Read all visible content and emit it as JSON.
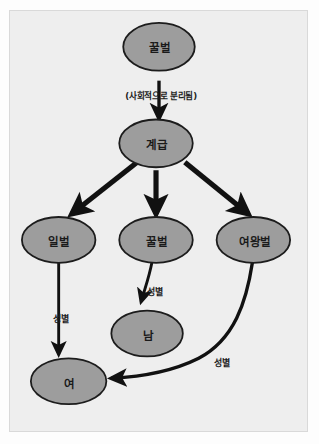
{
  "figure": {
    "background_color": "#eeeeee",
    "frame_color": "#d9d9d9",
    "node_fill": "#9d9d9d",
    "node_stroke": "#1c1c1c",
    "edge_color": "#111111",
    "text_color": "#1a1a1a"
  },
  "nodes": [
    {
      "id": "honeybee-root",
      "label": "꿀벌",
      "cx": 159,
      "cy": 45,
      "rx": 36,
      "ry": 24
    },
    {
      "id": "caste",
      "label": "계급",
      "cx": 155,
      "cy": 141,
      "rx": 37,
      "ry": 24
    },
    {
      "id": "worker-bee",
      "label": "일벌",
      "cx": 57,
      "cy": 241,
      "rx": 37,
      "ry": 23
    },
    {
      "id": "drone-bee",
      "label": "꿀벌",
      "cx": 155,
      "cy": 240,
      "rx": 37,
      "ry": 23
    },
    {
      "id": "queen-bee",
      "label": "여왕벌",
      "cx": 253,
      "cy": 240,
      "rx": 37,
      "ry": 23
    },
    {
      "id": "male",
      "label": "남",
      "cx": 146,
      "cy": 334,
      "rx": 36,
      "ry": 23
    },
    {
      "id": "female",
      "label": "여",
      "cx": 67,
      "cy": 382,
      "rx": 38,
      "ry": 23
    }
  ],
  "edges": [
    {
      "id": "honeybee-to-caste",
      "from": "honeybee-root",
      "to": "caste",
      "label": "(사회적으로 분리됨)",
      "label_x": 160,
      "label_y": 94,
      "style": "caption"
    },
    {
      "id": "caste-to-worker",
      "from": "caste",
      "to": "worker-bee",
      "label": "",
      "style": "thick"
    },
    {
      "id": "caste-to-drone",
      "from": "caste",
      "to": "drone-bee",
      "label": "",
      "style": "thick"
    },
    {
      "id": "caste-to-queen",
      "from": "caste",
      "to": "queen-bee",
      "label": "",
      "style": "thick"
    },
    {
      "id": "worker-to-female",
      "from": "worker-bee",
      "to": "female",
      "label": "성별",
      "label_x": 59,
      "label_y": 317,
      "style": "thin"
    },
    {
      "id": "drone-to-male",
      "from": "drone-bee",
      "to": "male",
      "label": "성별",
      "label_x": 153,
      "label_y": 290,
      "style": "thin"
    },
    {
      "id": "queen-to-female",
      "from": "queen-bee",
      "to": "female",
      "label": "성별",
      "label_x": 220,
      "label_y": 361,
      "style": "curve"
    }
  ]
}
